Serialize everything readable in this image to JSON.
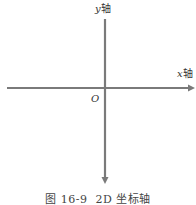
{
  "diagram": {
    "type": "2d-coordinate-axes",
    "axis_color": "#7a7a7a",
    "y_axis": {
      "variable": "y",
      "suffix": "轴",
      "arrow_direction": "down"
    },
    "x_axis": {
      "variable": "x",
      "suffix": "轴",
      "arrow_direction": "right"
    },
    "origin_label": "O"
  },
  "caption": {
    "figure_number": "图 16-9",
    "title": "2D 坐标轴"
  }
}
